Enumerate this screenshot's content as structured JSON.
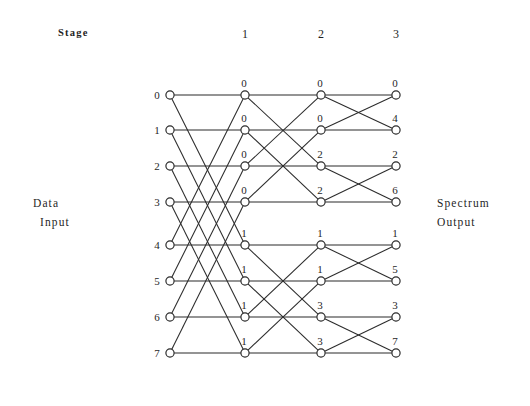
{
  "figure": {
    "type": "fft-butterfly-signal-flow-graph",
    "width": 530,
    "height": 406,
    "background_color": "#ffffff",
    "line_color": "#2b2b2b",
    "text_color": "#1f1f1f"
  },
  "labels": {
    "stage_word": "Stage",
    "left_title_line1": "Data",
    "left_title_line2": "Input",
    "right_title_line1": "Spectrum",
    "right_title_line2": "Output"
  },
  "stage_headers": [
    {
      "label": "1"
    },
    {
      "label": "2"
    },
    {
      "label": "3"
    }
  ],
  "input_indices": [
    "0",
    "1",
    "2",
    "3",
    "4",
    "5",
    "6",
    "7"
  ],
  "columns": [
    {
      "name": "input-column",
      "x": 170,
      "weights": []
    },
    {
      "name": "stage-1-column",
      "x": 245,
      "weights": [
        "0",
        "0",
        "0",
        "0",
        "1",
        "1",
        "1",
        "1"
      ]
    },
    {
      "name": "stage-2-column",
      "x": 321,
      "weights": [
        "0",
        "0",
        "2",
        "2",
        "1",
        "1",
        "3",
        "3"
      ]
    },
    {
      "name": "stage-3-column",
      "x": 396,
      "weights": [
        "0",
        "4",
        "2",
        "6",
        "1",
        "5",
        "3",
        "7"
      ]
    }
  ],
  "output_indices": [
    "0",
    "4",
    "2",
    "6",
    "1",
    "5",
    "3",
    "7"
  ],
  "chart_data": {
    "type": "diagram",
    "rows": 8,
    "stages": 3,
    "row_y": [
      95,
      130,
      166,
      202,
      245,
      281,
      317,
      353
    ],
    "column_x": [
      170,
      245,
      321,
      396
    ],
    "butterfly_span": [
      4,
      2,
      1
    ],
    "stage_weights": [
      [
        "0",
        "0",
        "0",
        "0",
        "1",
        "1",
        "1",
        "1"
      ],
      [
        "0",
        "0",
        "2",
        "2",
        "1",
        "1",
        "3",
        "3"
      ],
      [
        "0",
        "4",
        "2",
        "6",
        "1",
        "5",
        "3",
        "7"
      ]
    ],
    "input_order": [
      0,
      1,
      2,
      3,
      4,
      5,
      6,
      7
    ],
    "output_order": [
      0,
      4,
      2,
      6,
      1,
      5,
      3,
      7
    ]
  }
}
